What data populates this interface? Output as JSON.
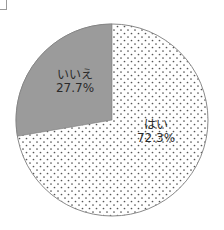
{
  "chart_data": {
    "type": "pie",
    "title": "",
    "categories": [
      "はい",
      "いいえ"
    ],
    "values": [
      72.3,
      27.7
    ],
    "unit": "%",
    "slices": [
      {
        "label": "はい",
        "value": 72.3,
        "display": "72.3%",
        "fill": "dotted",
        "color": "#ffffff",
        "dot_color": "#555555"
      },
      {
        "label": "いいえ",
        "value": 27.7,
        "display": "27.7%",
        "fill": "solid",
        "color": "#9b9b9b"
      }
    ],
    "start_angle": "12 o'clock",
    "direction": "いいえ counterclockwise from top; はい clockwise from top",
    "legend": "none (labels inside slices)"
  },
  "labels": {
    "no": {
      "name": "いいえ",
      "pct": "27.7%"
    },
    "yes": {
      "name": "はい",
      "pct": "72.3%"
    }
  }
}
